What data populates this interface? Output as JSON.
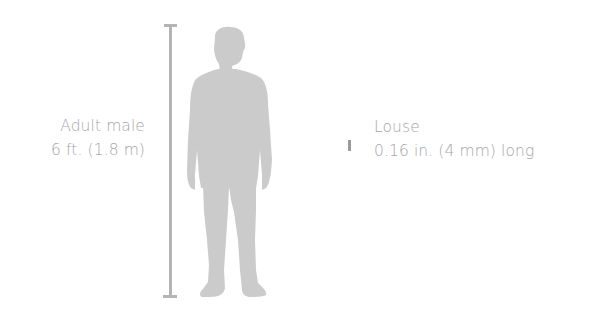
{
  "human": {
    "name": "Adult male",
    "size": "6 ft. (1.8 m)"
  },
  "louse": {
    "name": "Louse",
    "size": "0.16 in. (4 mm) long"
  },
  "colors": {
    "silhouette": "#cbcbcb",
    "scale_bar": "#b4b4b4",
    "text": "#a6a6a6",
    "louse_marker": "#9a9a9a"
  }
}
